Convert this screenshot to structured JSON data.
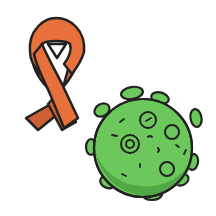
{
  "image": {
    "description": "Clip-art illustration of an orange awareness ribbon and a green cartoon virus particle",
    "elements": [
      {
        "name": "awareness-ribbon",
        "color": "#e8703a",
        "shade": "#c95a2e"
      },
      {
        "name": "virus",
        "color": "#6cc85a",
        "shade": "#4fa743",
        "outline": "#1f2a1a"
      }
    ]
  },
  "colors": {
    "background": "#ffffff",
    "ribbon": "#e8703a",
    "ribbon_dark": "#cf5f34",
    "virus": "#6cc85a",
    "virus_dark": "#52a846",
    "outline": "#222222"
  }
}
